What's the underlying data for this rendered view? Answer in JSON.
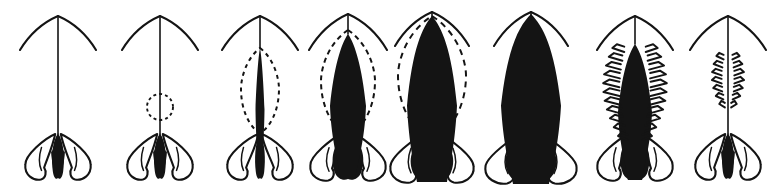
{
  "figure": {
    "title": "Developmental series of eight stages",
    "width": 772,
    "height": 193,
    "background_color": "#ffffff",
    "ink_color": "#141414",
    "style": "black-and-white line drawing",
    "panel_count": 8,
    "orientation": "horizontal row, left to right"
  },
  "panels": [
    {
      "index": 1,
      "name": "stage-1",
      "center_x": 58,
      "apex_y": 16,
      "stem": {
        "top_y": 16,
        "bottom_y": 134,
        "width": 1.6,
        "visible": true
      },
      "arms": {
        "visible": true,
        "span": 76,
        "drop": 34,
        "style": "curved-downswept"
      },
      "body": {
        "visible": true,
        "fill": "solid-black",
        "top_y": 134,
        "bottom_y": 176,
        "half_width": 7,
        "shape": "slender-spindle"
      },
      "dashed_guide": {
        "visible": false,
        "shape": "none",
        "half_width": 0,
        "top_y": 0,
        "bottom_y": 0
      },
      "hatching": {
        "visible": false,
        "rows": 0
      },
      "base": {
        "visible": true,
        "top_y": 133,
        "bottom_y": 181,
        "half_width": 33,
        "lobes": 3
      },
      "label": "Stage 1"
    },
    {
      "index": 2,
      "name": "stage-2",
      "center_x": 160,
      "apex_y": 16,
      "stem": {
        "top_y": 16,
        "bottom_y": 134,
        "width": 1.6,
        "visible": true
      },
      "arms": {
        "visible": true,
        "span": 76,
        "drop": 34,
        "style": "curved-downswept"
      },
      "body": {
        "visible": true,
        "fill": "solid-black",
        "top_y": 134,
        "bottom_y": 176,
        "half_width": 7,
        "shape": "slender-spindle"
      },
      "dashed_guide": {
        "visible": true,
        "shape": "small-circle",
        "center_y": 107,
        "radius": 13,
        "dash": "3 3"
      },
      "hatching": {
        "visible": false,
        "rows": 0
      },
      "base": {
        "visible": true,
        "top_y": 133,
        "bottom_y": 181,
        "half_width": 33,
        "lobes": 3
      },
      "label": "Stage 2"
    },
    {
      "index": 3,
      "name": "stage-3",
      "center_x": 260,
      "apex_y": 16,
      "stem": {
        "top_y": 16,
        "bottom_y": 48,
        "width": 1.6,
        "visible": true
      },
      "arms": {
        "visible": true,
        "span": 76,
        "drop": 34,
        "style": "curved-downswept"
      },
      "body": {
        "visible": true,
        "fill": "solid-black",
        "top_y": 48,
        "bottom_y": 176,
        "half_width": 4.5,
        "shape": "narrow-lens"
      },
      "dashed_guide": {
        "visible": true,
        "shape": "lens-ellipse",
        "top_y": 48,
        "bottom_y": 133,
        "half_width": 19,
        "dash": "4 4"
      },
      "hatching": {
        "visible": false,
        "rows": 0
      },
      "base": {
        "visible": true,
        "top_y": 133,
        "bottom_y": 181,
        "half_width": 33,
        "lobes": 3
      },
      "label": "Stage 3"
    },
    {
      "index": 4,
      "name": "stage-4",
      "center_x": 348,
      "apex_y": 14,
      "stem": {
        "top_y": 14,
        "bottom_y": 34,
        "width": 1.6,
        "visible": true
      },
      "arms": {
        "visible": true,
        "span": 78,
        "drop": 36,
        "style": "curved-downswept"
      },
      "body": {
        "visible": true,
        "fill": "solid-black",
        "top_y": 34,
        "bottom_y": 178,
        "half_width": 18,
        "shape": "broad-spindle"
      },
      "dashed_guide": {
        "visible": true,
        "shape": "lens-ellipse",
        "top_y": 30,
        "bottom_y": 136,
        "half_width": 27,
        "dash": "5 4"
      },
      "hatching": {
        "visible": false,
        "rows": 0
      },
      "base": {
        "visible": true,
        "top_y": 133,
        "bottom_y": 182,
        "half_width": 38,
        "lobes": 3
      },
      "label": "Stage 4"
    },
    {
      "index": 5,
      "name": "stage-5",
      "center_x": 432,
      "apex_y": 12,
      "stem": {
        "top_y": 12,
        "bottom_y": 24,
        "width": 1.6,
        "visible": true
      },
      "arms": {
        "visible": true,
        "span": 74,
        "drop": 34,
        "style": "curved-downswept"
      },
      "body": {
        "visible": true,
        "fill": "solid-black",
        "top_y": 16,
        "bottom_y": 182,
        "half_width": 25,
        "shape": "broad-club"
      },
      "dashed_guide": {
        "visible": true,
        "shape": "lens-ellipse",
        "top_y": 16,
        "bottom_y": 140,
        "half_width": 34,
        "dash": "6 5"
      },
      "hatching": {
        "visible": false,
        "rows": 0
      },
      "base": {
        "visible": true,
        "top_y": 133,
        "bottom_y": 184,
        "half_width": 42,
        "lobes": 3
      },
      "label": "Stage 5"
    },
    {
      "index": 6,
      "name": "stage-6",
      "center_x": 531,
      "apex_y": 12,
      "stem": {
        "top_y": 12,
        "bottom_y": 20,
        "width": 1.6,
        "visible": true
      },
      "arms": {
        "visible": true,
        "span": 74,
        "drop": 34,
        "style": "curved-downswept"
      },
      "body": {
        "visible": true,
        "fill": "solid-black",
        "top_y": 14,
        "bottom_y": 184,
        "half_width": 30,
        "shape": "broad-club"
      },
      "dashed_guide": {
        "visible": false,
        "shape": "none",
        "half_width": 0,
        "top_y": 0,
        "bottom_y": 0
      },
      "hatching": {
        "visible": false,
        "rows": 0
      },
      "base": {
        "visible": true,
        "top_y": 133,
        "bottom_y": 185,
        "half_width": 46,
        "lobes": 3
      },
      "label": "Stage 6"
    },
    {
      "index": 7,
      "name": "stage-7",
      "center_x": 635,
      "apex_y": 16,
      "stem": {
        "top_y": 16,
        "bottom_y": 44,
        "width": 1.6,
        "visible": true
      },
      "arms": {
        "visible": true,
        "span": 76,
        "drop": 34,
        "style": "curved-downswept"
      },
      "body": {
        "visible": true,
        "fill": "solid-black",
        "top_y": 44,
        "bottom_y": 180,
        "half_width": 17,
        "shape": "broad-spindle"
      },
      "dashed_guide": {
        "visible": false,
        "shape": "none",
        "half_width": 0,
        "top_y": 0,
        "bottom_y": 0
      },
      "hatching": {
        "visible": true,
        "rows": 11,
        "top_y": 48,
        "bottom_y": 136,
        "reach": 15,
        "style": "lateral-zigzag-ribs"
      },
      "base": {
        "visible": true,
        "top_y": 133,
        "bottom_y": 182,
        "half_width": 38,
        "lobes": 3
      },
      "label": "Stage 7"
    },
    {
      "index": 8,
      "name": "stage-8",
      "center_x": 728,
      "apex_y": 16,
      "stem": {
        "top_y": 16,
        "bottom_y": 134,
        "width": 1.6,
        "visible": true
      },
      "arms": {
        "visible": true,
        "span": 76,
        "drop": 34,
        "style": "curved-downswept"
      },
      "body": {
        "visible": true,
        "fill": "solid-black",
        "top_y": 134,
        "bottom_y": 176,
        "half_width": 7,
        "shape": "slender-spindle"
      },
      "dashed_guide": {
        "visible": false,
        "shape": "none",
        "half_width": 0,
        "top_y": 0,
        "bottom_y": 0
      },
      "hatching": {
        "visible": true,
        "rows": 7,
        "top_y": 56,
        "bottom_y": 104,
        "reach": 9,
        "style": "lateral-zigzag-ribs"
      },
      "base": {
        "visible": true,
        "top_y": 133,
        "bottom_y": 181,
        "half_width": 33,
        "lobes": 3
      },
      "label": "Stage 8"
    }
  ]
}
